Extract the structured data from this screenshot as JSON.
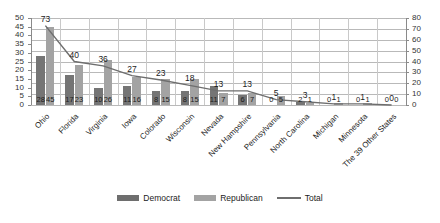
{
  "chart_data": {
    "type": "bar",
    "title": "",
    "subtitle": "",
    "xlabel": "",
    "ylabel": "",
    "categories": [
      "Ohio",
      "Florida",
      "Virginia",
      "Iowa",
      "Colorado",
      "Wisconsin",
      "Nevada",
      "New Hampshire",
      "Pennsylvania",
      "North Carolina",
      "Michigan",
      "Minnesota",
      "The 39 Other States"
    ],
    "series": [
      {
        "name": "Democrat",
        "type": "bar",
        "axis": "left",
        "values": [
          28,
          17,
          10,
          11,
          8,
          8,
          11,
          6,
          0,
          2,
          0,
          0,
          0
        ]
      },
      {
        "name": "Republican",
        "type": "bar",
        "axis": "left",
        "values": [
          45,
          23,
          26,
          16,
          15,
          15,
          7,
          7,
          5,
          1,
          1,
          1,
          0
        ]
      },
      {
        "name": "Total",
        "type": "line",
        "axis": "right",
        "values": [
          73,
          40,
          36,
          27,
          23,
          18,
          13,
          13,
          5,
          3,
          1,
          1,
          0
        ]
      }
    ],
    "left_axis": {
      "min": 0,
      "max": 50,
      "step": 5,
      "ticks": [
        "0",
        "5",
        "10",
        "15",
        "20",
        "25",
        "30",
        "35",
        "40",
        "45",
        "50"
      ]
    },
    "right_axis": {
      "min": 0,
      "max": 80,
      "step": 10,
      "ticks": [
        "0",
        "10",
        "20",
        "30",
        "40",
        "50",
        "60",
        "70",
        "80"
      ]
    },
    "grid": true,
    "legend_position": "bottom",
    "colors": {
      "democrat": "#757575",
      "republican": "#a3a3a3",
      "total_line": "#6e6e6e",
      "gridline": "#b9b9b9",
      "axis": "#8a8a8a",
      "background": "#ffffff"
    }
  },
  "legend": {
    "items": [
      {
        "label": "Democrat",
        "kind": "swatch-dem"
      },
      {
        "label": "Republican",
        "kind": "swatch-rep"
      },
      {
        "label": "Total",
        "kind": "swatch-line"
      }
    ]
  }
}
